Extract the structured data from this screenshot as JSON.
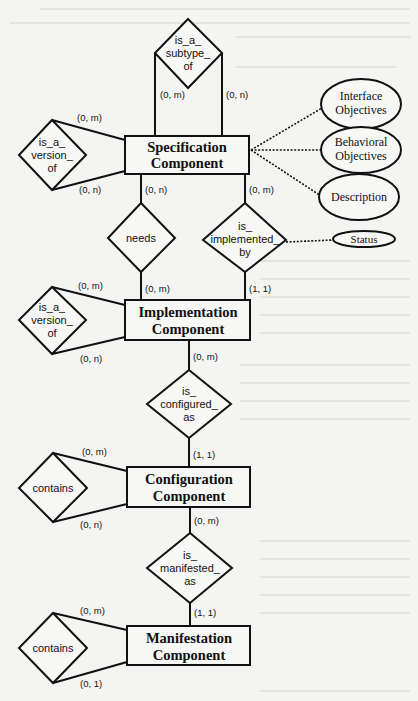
{
  "diagram": {
    "type": "entity-relationship",
    "entities": [
      {
        "id": "spec",
        "line1": "Specification",
        "line2": "Component"
      },
      {
        "id": "impl",
        "line1": "Implementation",
        "line2": "Component"
      },
      {
        "id": "config",
        "line1": "Configuration",
        "line2": "Component"
      },
      {
        "id": "manif",
        "line1": "Manifestation",
        "line2": "Component"
      }
    ],
    "relationships": [
      {
        "id": "subtype",
        "lines": [
          "is_a_",
          "subtype_",
          "of"
        ]
      },
      {
        "id": "spec_version",
        "lines": [
          "is_a_",
          "version_",
          "of"
        ]
      },
      {
        "id": "needs",
        "lines": [
          "needs"
        ]
      },
      {
        "id": "implemented",
        "lines": [
          "is_",
          "implemented_",
          "by"
        ]
      },
      {
        "id": "impl_version",
        "lines": [
          "is_a_",
          "version_",
          "of"
        ]
      },
      {
        "id": "configured",
        "lines": [
          "is_",
          "configured_",
          "as"
        ]
      },
      {
        "id": "config_contains",
        "lines": [
          "contains"
        ]
      },
      {
        "id": "manifested",
        "lines": [
          "is_",
          "manifested_",
          "as"
        ]
      },
      {
        "id": "manif_contains",
        "lines": [
          "contains"
        ]
      }
    ],
    "attributes": [
      {
        "id": "interface",
        "line1": "Interface",
        "line2": "Objectives"
      },
      {
        "id": "behavioral",
        "line1": "Behavioral",
        "line2": "Objectives"
      },
      {
        "id": "description",
        "line1": "Description"
      },
      {
        "id": "status",
        "line1": "Status"
      }
    ],
    "cardinalities": {
      "subtype_left": "(0, m)",
      "subtype_right": "(0, n)",
      "spec_version_top": "(0, m)",
      "spec_version_bottom": "(0, n)",
      "spec_needs": "(0, n)",
      "spec_implemented": "(0, m)",
      "impl_needs": "(0, m)",
      "impl_implemented": "(1, 1)",
      "impl_version_top": "(0, m)",
      "impl_version_bottom": "(0, n)",
      "impl_configured": "(0, m)",
      "config_configured": "(1, 1)",
      "config_contains_top": "(0, m)",
      "config_contains_bottom": "(0, n)",
      "config_manifested": "(0, m)",
      "manif_manifested": "(1, 1)",
      "manif_contains_top": "(0, m)",
      "manif_contains_bottom": "(0, 1)"
    }
  }
}
